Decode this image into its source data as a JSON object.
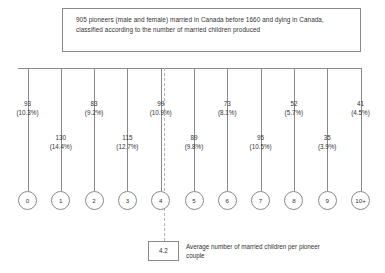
{
  "title": {
    "text": "905 pioneers (male and female) married in Canada before 1660 and dying in Canada, classified according to the number of married children produced"
  },
  "chart_data": {
    "type": "bar",
    "title": "905 pioneers (male and female) married in Canada before 1660 and dying in Canada, classified according to the number of married children produced",
    "xlabel": "Number of married children produced",
    "ylabel": "Number of pioneers",
    "total": 905,
    "categories": [
      "0",
      "1",
      "2",
      "3",
      "4",
      "5",
      "6",
      "7",
      "8",
      "9",
      "10+"
    ],
    "values": [
      93,
      130,
      83,
      115,
      99,
      89,
      73,
      95,
      52,
      35,
      41
    ],
    "percent_labels": [
      "(10.3%)",
      "(14.4%)",
      "(9.2%)",
      "(12.7%)",
      "(10.9%)",
      "(9.8%)",
      "(8.1%)",
      "(10.5%)",
      "(5.7%)",
      "(3.9%)",
      "(4.5%)"
    ],
    "percents": [
      10.3,
      14.4,
      9.2,
      12.7,
      10.9,
      9.8,
      8.1,
      10.5,
      5.7,
      3.9,
      4.5
    ],
    "average": "4.2",
    "average_caption": "Average number of married children per pioneer couple",
    "grid": false,
    "legend": false
  },
  "nodes": [
    {
      "label": "0"
    },
    {
      "label": "1"
    },
    {
      "label": "2"
    },
    {
      "label": "3"
    },
    {
      "label": "4"
    },
    {
      "label": "5"
    },
    {
      "label": "6"
    },
    {
      "label": "7"
    },
    {
      "label": "8"
    },
    {
      "label": "9"
    },
    {
      "label": "10+"
    }
  ],
  "average_box": {
    "value": "4.2",
    "caption": "Average number of married children per pioneer couple"
  },
  "colors": {
    "line": "#8a8a8a",
    "dashed": "#b3b3b3",
    "text": "#333333",
    "background": "#ffffff"
  }
}
